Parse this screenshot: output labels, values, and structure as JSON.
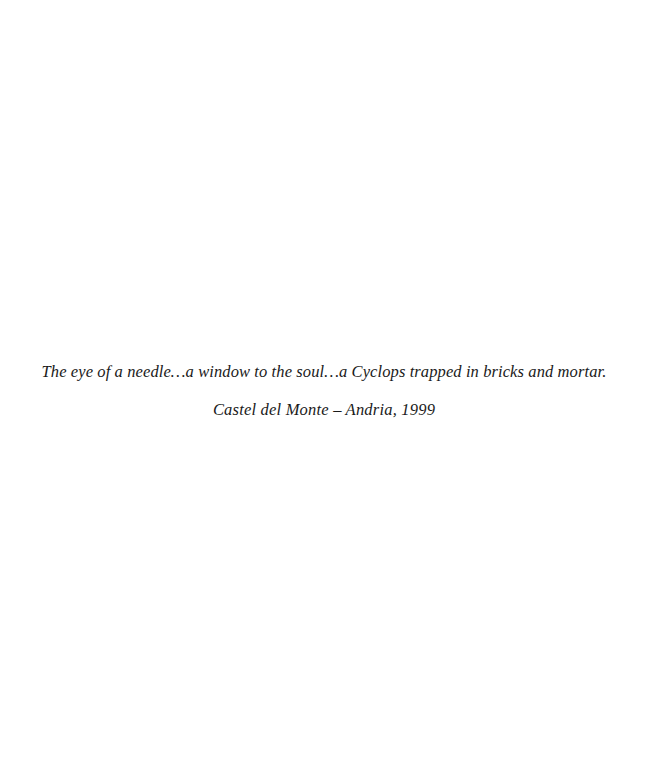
{
  "caption": {
    "quote": "The eye of a needle…a window to the soul…a Cyclops trapped in bricks and mortar.",
    "location_date": "Castel del Monte – Andria, 1999"
  }
}
